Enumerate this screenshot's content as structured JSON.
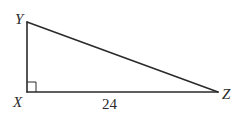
{
  "diagram": {
    "type": "right-triangle",
    "vertices": {
      "Y": {
        "label": "Y",
        "x": 27,
        "y": 22
      },
      "X": {
        "label": "X",
        "x": 27,
        "y": 92
      },
      "Z": {
        "label": "Z",
        "x": 218,
        "y": 92
      }
    },
    "right_angle_at": "X",
    "sides": [
      {
        "from": "X",
        "to": "Y",
        "label": ""
      },
      {
        "from": "X",
        "to": "Z",
        "label": "24"
      },
      {
        "from": "Y",
        "to": "Z",
        "label": ""
      }
    ],
    "labels": {
      "Y": "Y",
      "X": "X",
      "Z": "Z",
      "XZ": "24"
    },
    "colors": {
      "stroke": "#2a2a2a",
      "background": "#ffffff"
    }
  }
}
